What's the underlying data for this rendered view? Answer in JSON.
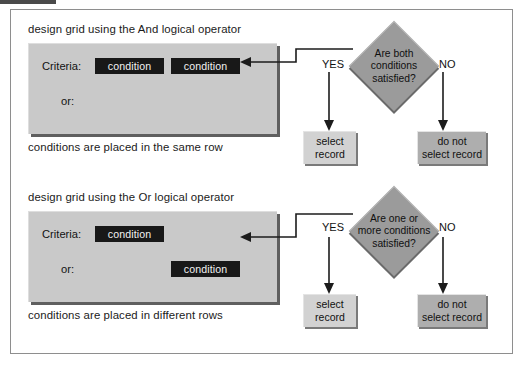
{
  "page": {
    "width": 524,
    "height": 369,
    "background": "#ffffff",
    "frame_color": "#8e8e8e"
  },
  "colors": {
    "grid_panel": "#c9c9c9",
    "condition_chip": "#181818",
    "condition_text": "#f2f2f2",
    "diamond": "#9b9b9b",
    "result_light": "#d2d2d2",
    "result_dark": "#aeaeae",
    "line": "#1c1c1c",
    "shadow": "#5f5f5f"
  },
  "sections": [
    {
      "id": "and-operator",
      "title": "design grid using the And logical operator",
      "footer": "conditions are placed in the same row",
      "grid": {
        "criteria_label": "Criteria:",
        "or_label": "or:",
        "criteria_row": [
          "condition",
          "condition"
        ],
        "or_row": []
      },
      "decision": {
        "text_lines": [
          "Are both",
          "conditions",
          "satisfied?"
        ],
        "yes_label": "YES",
        "no_label": "NO",
        "yes_result": [
          "select",
          "record"
        ],
        "no_result": [
          "do not",
          "select record"
        ]
      }
    },
    {
      "id": "or-operator",
      "title": "design grid using the Or logical operator",
      "footer": "conditions are placed in different rows",
      "grid": {
        "criteria_label": "Criteria:",
        "or_label": "or:",
        "criteria_row": [
          "condition"
        ],
        "or_row": [
          "condition"
        ]
      },
      "decision": {
        "text_lines": [
          "Are one or",
          "more conditions",
          "satisfied?"
        ],
        "yes_label": "YES",
        "no_label": "NO",
        "yes_result": [
          "select",
          "record"
        ],
        "no_result": [
          "do not",
          "select record"
        ]
      }
    }
  ]
}
